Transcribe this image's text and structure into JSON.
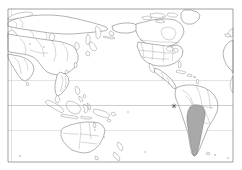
{
  "figure": {
    "type": "world-map",
    "projection": "pacific-centered-cylindrical",
    "background_color": "#ffffff",
    "frame": {
      "x": 8,
      "y": 9,
      "width": 225,
      "height": 153,
      "stroke": "#7a7a7a"
    }
  },
  "colors": {
    "land_fill": "#ffffff",
    "coastline": "#555555",
    "country_border": "#777777",
    "highlight_fill": "#a9a9a9",
    "highlight_stroke": "#6d6d6d",
    "gridline": "#9a9a9a",
    "gridline_faint": "#c9c9c9",
    "marker": "#4a4a4a"
  },
  "gridlines": {
    "latitudes": [
      {
        "name": "equator",
        "y": 105.5,
        "style": "solid"
      },
      {
        "name": "tropic-of-capricorn",
        "y": 130.5,
        "style": "faint"
      },
      {
        "name": "tropic-of-cancer",
        "y": 80.5,
        "style": "faint"
      }
    ],
    "longitudes": [
      {
        "name": "left-meridian",
        "x": 11.5,
        "style": "faint"
      }
    ]
  },
  "highlighted_regions": [
    {
      "name": "argentina",
      "fill": "#a9a9a9",
      "label": "Argentina"
    }
  ],
  "markers": [
    {
      "name": "location-marker",
      "x": 174,
      "y": 106,
      "glyph": "asterisk"
    }
  ],
  "landmasses": [
    {
      "name": "asia-siberia"
    },
    {
      "name": "southeast-asia"
    },
    {
      "name": "indonesia"
    },
    {
      "name": "australia"
    },
    {
      "name": "new-zealand"
    },
    {
      "name": "papua-new-guinea"
    },
    {
      "name": "japan"
    },
    {
      "name": "north-america"
    },
    {
      "name": "greenland"
    },
    {
      "name": "central-america"
    },
    {
      "name": "south-america"
    },
    {
      "name": "africa-west-edge"
    }
  ]
}
